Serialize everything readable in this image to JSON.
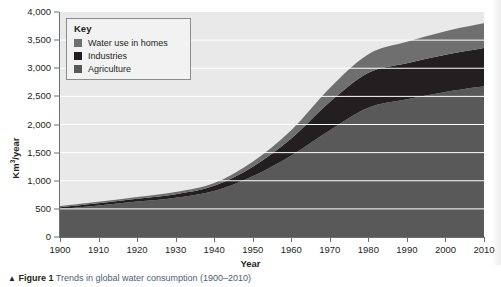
{
  "figure": {
    "caption_marker": "▲",
    "caption_number": "Figure 1",
    "caption_text": "Trends in global water consumption (1900–2010)"
  },
  "legend": {
    "title": "Key",
    "items": [
      {
        "label": "Water use in homes",
        "color": "#6f6f6f"
      },
      {
        "label": "Industries",
        "color": "#231f20"
      },
      {
        "label": "Agriculture",
        "color": "#595959"
      }
    ]
  },
  "axes": {
    "y_title_main": "Km",
    "y_title_sup": "3",
    "y_title_rest": "/year",
    "x_title": "Year",
    "y_ticks": [
      "0",
      "500",
      "1,000",
      "1,500",
      "2,000",
      "2,500",
      "3,000",
      "3,500",
      "4,000"
    ],
    "x_ticks": [
      "1900",
      "1910",
      "1920",
      "1930",
      "1940",
      "1950",
      "1960",
      "1970",
      "1980",
      "1990",
      "2000",
      "2010"
    ]
  },
  "chart_data": {
    "type": "area",
    "title": "Trends in global water consumption (1900–2010)",
    "xlabel": "Year",
    "ylabel": "Km3/year",
    "xlim": [
      1900,
      2010
    ],
    "ylim": [
      0,
      4000
    ],
    "ytick_step": 500,
    "grid": true,
    "gridline_color": "#ffffff",
    "plot_background": "#e9e9e9",
    "legend_position": "top-left-inside",
    "stacked": true,
    "x": [
      1900,
      1910,
      1920,
      1930,
      1940,
      1950,
      1960,
      1970,
      1980,
      1990,
      2000,
      2010
    ],
    "series": [
      {
        "name": "Agriculture",
        "color": "#595959",
        "values": [
          500,
          560,
          630,
          700,
          820,
          1080,
          1450,
          1900,
          2300,
          2450,
          2580,
          2680
        ]
      },
      {
        "name": "Industries",
        "color": "#231f20",
        "values": [
          30,
          40,
          50,
          60,
          90,
          170,
          300,
          500,
          620,
          640,
          660,
          680
        ]
      },
      {
        "name": "Water use in homes",
        "color": "#6f6f6f",
        "values": [
          20,
          25,
          30,
          40,
          50,
          90,
          150,
          250,
          330,
          380,
          420,
          440
        ]
      }
    ],
    "totals": [
      550,
      625,
      710,
      800,
      960,
      1340,
      1900,
      2650,
      3250,
      3470,
      3660,
      3800
    ]
  }
}
